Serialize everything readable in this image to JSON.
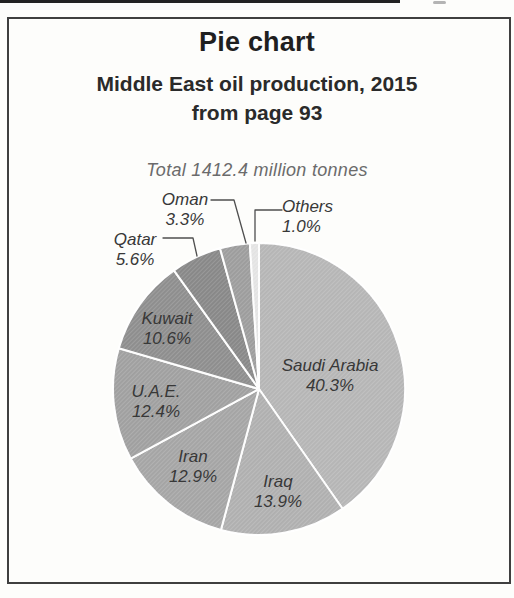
{
  "header": {
    "title": "Pie chart",
    "subtitle_line1": "Middle East oil production, 2015",
    "subtitle_line2": "from page 93"
  },
  "total_caption": "Total 1412.4 million tonnes",
  "chart_data": {
    "type": "pie",
    "title": "Pie chart",
    "subtitle": "Middle East oil production, 2015",
    "source_note": "from page 93",
    "total_label": "Total 1412.4 million tonnes",
    "total_value_million_tonnes": 1412.4,
    "unit": "percent of total",
    "start_angle_deg": 0,
    "direction": "clockwise",
    "legend_position": "labels-on-and-around-slices",
    "slices": [
      {
        "label": "Saudi Arabia",
        "value_pct": 40.3,
        "pct_label": "40.3%",
        "color": "#b8b8b8",
        "label_placement": "inside"
      },
      {
        "label": "Iraq",
        "value_pct": 13.9,
        "pct_label": "13.9%",
        "color": "#b2b2b2",
        "label_placement": "inside"
      },
      {
        "label": "Iran",
        "value_pct": 12.9,
        "pct_label": "12.9%",
        "color": "#a7a7a7",
        "label_placement": "inside"
      },
      {
        "label": "U.A.E.",
        "value_pct": 12.4,
        "pct_label": "12.4%",
        "color": "#a2a2a2",
        "label_placement": "inside"
      },
      {
        "label": "Kuwait",
        "value_pct": 10.6,
        "pct_label": "10.6%",
        "color": "#909090",
        "label_placement": "inside"
      },
      {
        "label": "Qatar",
        "value_pct": 5.6,
        "pct_label": "5.6%",
        "color": "#8a8a8a",
        "label_placement": "outside"
      },
      {
        "label": "Oman",
        "value_pct": 3.3,
        "pct_label": "3.3%",
        "color": "#9f9f9f",
        "label_placement": "outside"
      },
      {
        "label": "Others",
        "value_pct": 1.0,
        "pct_label": "1.0%",
        "color": "#e6e6e6",
        "label_placement": "outside"
      }
    ],
    "slice_divider_color": "#ffffff",
    "leader_line_color": "#4f4f4f"
  }
}
